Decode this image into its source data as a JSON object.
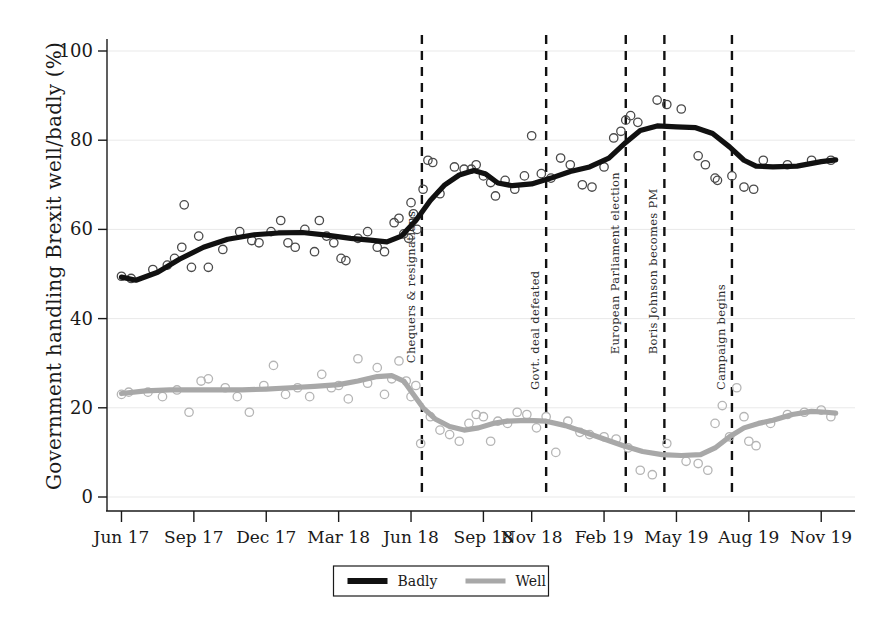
{
  "chart_data": {
    "type": "scatter",
    "title": "",
    "xlabel": "",
    "ylabel": "Government handling Brexit well/badly (%)",
    "ylim": [
      0,
      100
    ],
    "yticks": [
      0,
      20,
      40,
      60,
      80,
      100
    ],
    "ytick_labels": [
      "0",
      "20",
      "40",
      "60",
      "80",
      "100"
    ],
    "xtick_labels": [
      "Jun 17",
      "Sep 17",
      "Dec 17",
      "Mar 18",
      "Jun 18",
      "Sep 18",
      "Nov 18",
      "Feb 19",
      "May 19",
      "Aug 19",
      "Nov 19"
    ],
    "xtick_positions": [
      0,
      3,
      6,
      9,
      12,
      15,
      17,
      20,
      23,
      26,
      29
    ],
    "xlim": [
      -0.6,
      30.4
    ],
    "grid": true,
    "legend_position": "bottom",
    "series": [
      {
        "name": "Badly",
        "color": "#111111",
        "points": [
          {
            "x": 0.0,
            "y": 49.5
          },
          {
            "x": 0.4,
            "y": 49.0
          },
          {
            "x": 1.3,
            "y": 51.0
          },
          {
            "x": 1.9,
            "y": 52.0
          },
          {
            "x": 2.2,
            "y": 53.5
          },
          {
            "x": 2.5,
            "y": 56.0
          },
          {
            "x": 2.6,
            "y": 65.5
          },
          {
            "x": 2.9,
            "y": 51.5
          },
          {
            "x": 3.2,
            "y": 58.5
          },
          {
            "x": 3.6,
            "y": 51.5
          },
          {
            "x": 4.2,
            "y": 55.5
          },
          {
            "x": 4.9,
            "y": 59.5
          },
          {
            "x": 5.4,
            "y": 57.5
          },
          {
            "x": 5.7,
            "y": 57.0
          },
          {
            "x": 6.2,
            "y": 59.5
          },
          {
            "x": 6.6,
            "y": 62.0
          },
          {
            "x": 6.9,
            "y": 57.0
          },
          {
            "x": 7.2,
            "y": 56.0
          },
          {
            "x": 7.6,
            "y": 60.0
          },
          {
            "x": 8.0,
            "y": 55.0
          },
          {
            "x": 8.2,
            "y": 62.0
          },
          {
            "x": 8.5,
            "y": 58.5
          },
          {
            "x": 8.8,
            "y": 57.0
          },
          {
            "x": 9.1,
            "y": 53.5
          },
          {
            "x": 9.3,
            "y": 53.0
          },
          {
            "x": 9.8,
            "y": 58.0
          },
          {
            "x": 10.2,
            "y": 59.5
          },
          {
            "x": 10.6,
            "y": 56.0
          },
          {
            "x": 10.9,
            "y": 55.0
          },
          {
            "x": 11.3,
            "y": 61.5
          },
          {
            "x": 11.5,
            "y": 62.5
          },
          {
            "x": 11.7,
            "y": 59.0
          },
          {
            "x": 11.9,
            "y": 58.0
          },
          {
            "x": 12.0,
            "y": 66.0
          },
          {
            "x": 12.1,
            "y": 63.5
          },
          {
            "x": 12.25,
            "y": 60.0
          },
          {
            "x": 12.5,
            "y": 69.0
          },
          {
            "x": 12.7,
            "y": 75.5
          },
          {
            "x": 12.9,
            "y": 75.0
          },
          {
            "x": 13.2,
            "y": 68.0
          },
          {
            "x": 13.8,
            "y": 74.0
          },
          {
            "x": 14.2,
            "y": 73.5
          },
          {
            "x": 14.5,
            "y": 73.5
          },
          {
            "x": 14.7,
            "y": 74.5
          },
          {
            "x": 15.0,
            "y": 72.0
          },
          {
            "x": 15.3,
            "y": 70.5
          },
          {
            "x": 15.5,
            "y": 67.5
          },
          {
            "x": 15.9,
            "y": 71.0
          },
          {
            "x": 16.3,
            "y": 69.0
          },
          {
            "x": 16.7,
            "y": 72.0
          },
          {
            "x": 17.0,
            "y": 81.0
          },
          {
            "x": 17.4,
            "y": 72.5
          },
          {
            "x": 17.8,
            "y": 71.5
          },
          {
            "x": 18.2,
            "y": 76.0
          },
          {
            "x": 18.6,
            "y": 74.5
          },
          {
            "x": 19.1,
            "y": 70.0
          },
          {
            "x": 19.5,
            "y": 69.5
          },
          {
            "x": 20.0,
            "y": 74.0
          },
          {
            "x": 20.4,
            "y": 80.5
          },
          {
            "x": 20.7,
            "y": 82.0
          },
          {
            "x": 20.9,
            "y": 84.5
          },
          {
            "x": 21.1,
            "y": 85.5
          },
          {
            "x": 21.4,
            "y": 84.0
          },
          {
            "x": 22.2,
            "y": 89.0
          },
          {
            "x": 22.6,
            "y": 88.0
          },
          {
            "x": 23.2,
            "y": 87.0
          },
          {
            "x": 23.9,
            "y": 76.5
          },
          {
            "x": 24.2,
            "y": 74.5
          },
          {
            "x": 24.6,
            "y": 71.5
          },
          {
            "x": 24.7,
            "y": 71.0
          },
          {
            "x": 25.3,
            "y": 72.0
          },
          {
            "x": 25.8,
            "y": 69.5
          },
          {
            "x": 26.2,
            "y": 69.0
          },
          {
            "x": 26.6,
            "y": 75.5
          },
          {
            "x": 27.6,
            "y": 74.5
          },
          {
            "x": 28.6,
            "y": 75.5
          },
          {
            "x": 29.4,
            "y": 75.5
          }
        ],
        "trend": [
          {
            "x": 0.0,
            "y": 49.3
          },
          {
            "x": 0.6,
            "y": 48.6
          },
          {
            "x": 1.5,
            "y": 50.4
          },
          {
            "x": 2.4,
            "y": 53.3
          },
          {
            "x": 3.4,
            "y": 56.0
          },
          {
            "x": 4.4,
            "y": 57.8
          },
          {
            "x": 5.5,
            "y": 58.8
          },
          {
            "x": 6.5,
            "y": 59.2
          },
          {
            "x": 7.5,
            "y": 59.3
          },
          {
            "x": 8.5,
            "y": 58.7
          },
          {
            "x": 9.5,
            "y": 58.0
          },
          {
            "x": 10.3,
            "y": 57.6
          },
          {
            "x": 11.0,
            "y": 57.2
          },
          {
            "x": 11.6,
            "y": 58.5
          },
          {
            "x": 12.2,
            "y": 62.0
          },
          {
            "x": 12.8,
            "y": 66.5
          },
          {
            "x": 13.4,
            "y": 70.0
          },
          {
            "x": 14.0,
            "y": 72.2
          },
          {
            "x": 14.6,
            "y": 73.2
          },
          {
            "x": 15.1,
            "y": 72.4
          },
          {
            "x": 15.6,
            "y": 70.4
          },
          {
            "x": 16.2,
            "y": 69.8
          },
          {
            "x": 17.0,
            "y": 70.2
          },
          {
            "x": 17.8,
            "y": 71.5
          },
          {
            "x": 18.6,
            "y": 73.0
          },
          {
            "x": 19.4,
            "y": 74.0
          },
          {
            "x": 20.2,
            "y": 76.0
          },
          {
            "x": 20.9,
            "y": 79.5
          },
          {
            "x": 21.5,
            "y": 82.2
          },
          {
            "x": 22.2,
            "y": 83.2
          },
          {
            "x": 23.0,
            "y": 83.0
          },
          {
            "x": 23.8,
            "y": 82.8
          },
          {
            "x": 24.5,
            "y": 81.5
          },
          {
            "x": 25.2,
            "y": 78.5
          },
          {
            "x": 25.8,
            "y": 75.5
          },
          {
            "x": 26.3,
            "y": 74.2
          },
          {
            "x": 27.0,
            "y": 74.0
          },
          {
            "x": 28.0,
            "y": 74.2
          },
          {
            "x": 29.0,
            "y": 75.2
          },
          {
            "x": 29.6,
            "y": 75.6
          }
        ]
      },
      {
        "name": "Well",
        "color": "#a8a8a8",
        "points": [
          {
            "x": 0.0,
            "y": 23.0
          },
          {
            "x": 0.3,
            "y": 23.5
          },
          {
            "x": 1.1,
            "y": 23.5
          },
          {
            "x": 1.7,
            "y": 22.5
          },
          {
            "x": 2.3,
            "y": 24.0
          },
          {
            "x": 2.8,
            "y": 19.0
          },
          {
            "x": 3.3,
            "y": 26.0
          },
          {
            "x": 3.6,
            "y": 26.5
          },
          {
            "x": 4.3,
            "y": 24.5
          },
          {
            "x": 4.8,
            "y": 22.5
          },
          {
            "x": 5.3,
            "y": 19.0
          },
          {
            "x": 5.9,
            "y": 25.0
          },
          {
            "x": 6.3,
            "y": 29.5
          },
          {
            "x": 6.8,
            "y": 23.0
          },
          {
            "x": 7.3,
            "y": 24.5
          },
          {
            "x": 7.8,
            "y": 22.5
          },
          {
            "x": 8.3,
            "y": 27.5
          },
          {
            "x": 8.7,
            "y": 24.5
          },
          {
            "x": 9.0,
            "y": 25.0
          },
          {
            "x": 9.4,
            "y": 22.0
          },
          {
            "x": 9.8,
            "y": 31.0
          },
          {
            "x": 10.2,
            "y": 25.5
          },
          {
            "x": 10.6,
            "y": 29.0
          },
          {
            "x": 10.9,
            "y": 23.0
          },
          {
            "x": 11.2,
            "y": 26.5
          },
          {
            "x": 11.5,
            "y": 30.5
          },
          {
            "x": 11.8,
            "y": 26.0
          },
          {
            "x": 12.0,
            "y": 22.5
          },
          {
            "x": 12.2,
            "y": 25.0
          },
          {
            "x": 12.4,
            "y": 12.0
          },
          {
            "x": 12.8,
            "y": 18.0
          },
          {
            "x": 13.2,
            "y": 15.0
          },
          {
            "x": 13.6,
            "y": 14.0
          },
          {
            "x": 14.0,
            "y": 12.5
          },
          {
            "x": 14.4,
            "y": 16.5
          },
          {
            "x": 14.7,
            "y": 18.5
          },
          {
            "x": 15.0,
            "y": 18.0
          },
          {
            "x": 15.3,
            "y": 12.5
          },
          {
            "x": 15.6,
            "y": 17.0
          },
          {
            "x": 16.0,
            "y": 16.5
          },
          {
            "x": 16.4,
            "y": 19.0
          },
          {
            "x": 16.8,
            "y": 18.5
          },
          {
            "x": 17.2,
            "y": 15.5
          },
          {
            "x": 17.6,
            "y": 18.0
          },
          {
            "x": 18.0,
            "y": 10.0
          },
          {
            "x": 18.5,
            "y": 17.0
          },
          {
            "x": 19.0,
            "y": 14.5
          },
          {
            "x": 19.4,
            "y": 14.0
          },
          {
            "x": 20.0,
            "y": 13.5
          },
          {
            "x": 20.5,
            "y": 13.0
          },
          {
            "x": 21.0,
            "y": 11.0
          },
          {
            "x": 21.5,
            "y": 6.0
          },
          {
            "x": 22.0,
            "y": 5.0
          },
          {
            "x": 22.6,
            "y": 12.0
          },
          {
            "x": 23.4,
            "y": 8.0
          },
          {
            "x": 23.9,
            "y": 7.5
          },
          {
            "x": 24.3,
            "y": 6.0
          },
          {
            "x": 24.6,
            "y": 16.5
          },
          {
            "x": 24.9,
            "y": 20.5
          },
          {
            "x": 25.2,
            "y": 13.5
          },
          {
            "x": 25.5,
            "y": 24.5
          },
          {
            "x": 25.8,
            "y": 18.0
          },
          {
            "x": 26.0,
            "y": 12.5
          },
          {
            "x": 26.3,
            "y": 11.5
          },
          {
            "x": 26.9,
            "y": 16.5
          },
          {
            "x": 27.6,
            "y": 18.5
          },
          {
            "x": 28.3,
            "y": 19.0
          },
          {
            "x": 29.0,
            "y": 19.5
          },
          {
            "x": 29.4,
            "y": 18.0
          }
        ],
        "trend": [
          {
            "x": 0.0,
            "y": 23.2
          },
          {
            "x": 1.0,
            "y": 23.8
          },
          {
            "x": 2.0,
            "y": 24.0
          },
          {
            "x": 3.0,
            "y": 24.0
          },
          {
            "x": 4.0,
            "y": 24.0
          },
          {
            "x": 5.0,
            "y": 24.0
          },
          {
            "x": 6.0,
            "y": 24.2
          },
          {
            "x": 7.0,
            "y": 24.5
          },
          {
            "x": 8.0,
            "y": 24.8
          },
          {
            "x": 9.0,
            "y": 25.2
          },
          {
            "x": 9.8,
            "y": 26.0
          },
          {
            "x": 10.6,
            "y": 27.0
          },
          {
            "x": 11.2,
            "y": 27.2
          },
          {
            "x": 11.7,
            "y": 26.0
          },
          {
            "x": 12.1,
            "y": 23.0
          },
          {
            "x": 12.5,
            "y": 20.0
          },
          {
            "x": 13.0,
            "y": 17.5
          },
          {
            "x": 13.6,
            "y": 15.8
          },
          {
            "x": 14.2,
            "y": 15.0
          },
          {
            "x": 14.8,
            "y": 15.5
          },
          {
            "x": 15.4,
            "y": 16.5
          },
          {
            "x": 16.0,
            "y": 17.0
          },
          {
            "x": 16.8,
            "y": 17.2
          },
          {
            "x": 17.6,
            "y": 17.0
          },
          {
            "x": 18.4,
            "y": 16.0
          },
          {
            "x": 19.2,
            "y": 14.5
          },
          {
            "x": 20.0,
            "y": 13.0
          },
          {
            "x": 20.8,
            "y": 11.5
          },
          {
            "x": 21.6,
            "y": 10.2
          },
          {
            "x": 22.4,
            "y": 9.5
          },
          {
            "x": 23.2,
            "y": 9.3
          },
          {
            "x": 24.0,
            "y": 9.5
          },
          {
            "x": 24.6,
            "y": 11.0
          },
          {
            "x": 25.2,
            "y": 13.5
          },
          {
            "x": 25.8,
            "y": 15.5
          },
          {
            "x": 26.4,
            "y": 16.5
          },
          {
            "x": 27.0,
            "y": 17.2
          },
          {
            "x": 27.8,
            "y": 18.5
          },
          {
            "x": 28.6,
            "y": 19.2
          },
          {
            "x": 29.2,
            "y": 19.0
          },
          {
            "x": 29.6,
            "y": 18.8
          }
        ]
      }
    ],
    "annotations": [
      {
        "label": "Chequers & resignations",
        "x": 12.45,
        "y_top": 30
      },
      {
        "label": "Govt. deal defeated",
        "x": 17.6,
        "y_top": 24
      },
      {
        "label": "European Parliament election",
        "x": 20.9,
        "y_top": 32
      },
      {
        "label": "Boris Johnson becomes PM",
        "x": 22.5,
        "y_top": 32
      },
      {
        "label": "Campaign begins",
        "x": 25.3,
        "y_top": 24
      }
    ],
    "legend": [
      {
        "label": "Badly",
        "color": "#111111"
      },
      {
        "label": "Well",
        "color": "#a8a8a8"
      }
    ]
  }
}
